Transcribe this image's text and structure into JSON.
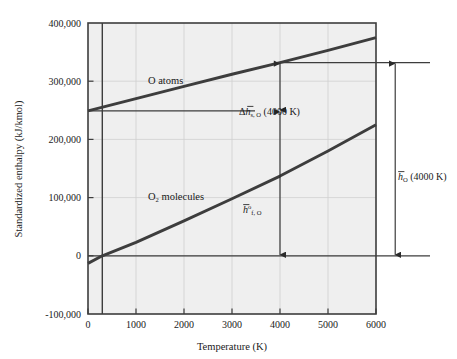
{
  "chart_data": {
    "type": "line",
    "title": "",
    "xlabel": "Temperature (K)",
    "ylabel": "Standardized enthalpy (kJ/kmol)",
    "xlim": [
      0,
      6000
    ],
    "ylim": [
      -100000,
      400000
    ],
    "grid": true,
    "legend_position": "inline-labels",
    "xticks": [
      0,
      1000,
      2000,
      3000,
      4000,
      5000,
      6000
    ],
    "xtick_labels": [
      "0",
      "1000",
      "2000",
      "3000",
      "4000",
      "5000",
      "6000"
    ],
    "yticks": [
      -100000,
      0,
      100000,
      200000,
      300000,
      400000
    ],
    "ytick_labels": [
      "-100,000",
      "0",
      "100,000",
      "200,000",
      "300,000",
      "400,000"
    ],
    "series": [
      {
        "name": "O atoms",
        "label": "O atoms",
        "x": [
          0,
          1000,
          2000,
          3000,
          4000,
          5000,
          6000
        ],
        "values": [
          249000,
          270000,
          291000,
          312000,
          332000,
          353000,
          375000
        ]
      },
      {
        "name": "O2 molecules",
        "label": "O",
        "label_sub": "2",
        "label_tail": " molecules",
        "x": [
          0,
          298,
          1000,
          2000,
          3000,
          4000,
          5000,
          6000
        ],
        "values": [
          -13000,
          0,
          23000,
          60000,
          98000,
          137000,
          180000,
          225000
        ]
      }
    ],
    "reference_lines": [
      {
        "name": "vertical-298K",
        "orientation": "vertical",
        "x": 298
      },
      {
        "name": "horizontal-formation-enthalpy",
        "orientation": "horizontal",
        "y": 249000
      },
      {
        "name": "horizontal-zero",
        "orientation": "horizontal",
        "y": 0
      },
      {
        "name": "horizontal-total-enthalpy-4000K",
        "orientation": "horizontal",
        "y": 332000
      }
    ],
    "annotations": [
      {
        "name": "sensible-enthalpy",
        "text": "Δh̄s, O (4000 K)",
        "parts": {
          "delta": "Δ",
          "h": "h",
          "sub": "s, O",
          "paren": "(4000 K)"
        },
        "at_x": 4000,
        "from_y": 249000,
        "to_y": 332000
      },
      {
        "name": "formation-enthalpy",
        "text": "h̄°f, O",
        "parts": {
          "h": "h",
          "sup": "o",
          "sub": "f, O"
        },
        "at_x": 4000,
        "from_y": 249000,
        "to_y": 0
      },
      {
        "name": "total-enthalpy",
        "text": "h̄O (4000 K)",
        "parts": {
          "h": "h",
          "sub": "O",
          "paren": "(4000 K)"
        },
        "at_x": 6400,
        "from_y": 332000,
        "to_y": 0
      }
    ],
    "colors": {
      "plot_background": "#efefef",
      "axis": "#3d3d3d",
      "gridline": "#cfcfcf",
      "series_line": "#3d3d3d",
      "annotation": "#2b2b2b",
      "text": "#1a1a1a",
      "figure_background": "#ffffff"
    }
  }
}
